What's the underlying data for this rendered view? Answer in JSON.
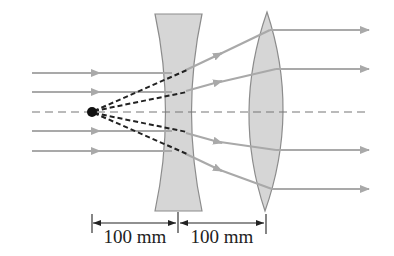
{
  "diagram": {
    "colors": {
      "background": "#ffffff",
      "ray": "#a9a9a9",
      "lens_fill": "#d6d6d6",
      "lens_stroke": "#8c8c8c",
      "axis": "#777777",
      "construction_lines": "#222222",
      "source_point": "#111111",
      "dimension": "#222222"
    },
    "elements": {
      "point_source": {
        "label": "virtual focal point",
        "x": 92,
        "y": 112
      },
      "concave_lens": {
        "label": "diverging lens",
        "x_center": 178
      },
      "convex_lens": {
        "label": "converging lens",
        "x_center": 266
      },
      "optical_axis": {
        "label": "optical axis"
      }
    },
    "incoming_rays_y": [
      73,
      92,
      131,
      151
    ],
    "outgoing_rays_y": [
      30,
      69,
      150,
      189
    ],
    "dimensions": [
      {
        "label": "100 mm",
        "from": "point source",
        "to": "diverging lens"
      },
      {
        "label": "100 mm",
        "from": "diverging lens",
        "to": "converging lens"
      }
    ]
  }
}
